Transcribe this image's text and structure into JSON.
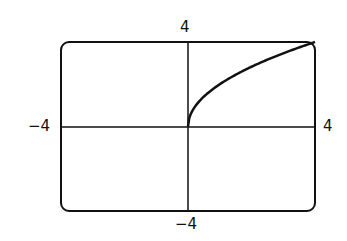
{
  "chart_data": {
    "type": "line",
    "title": "",
    "xlabel": "",
    "ylabel": "",
    "xlim": [
      -4,
      4
    ],
    "ylim": [
      -4,
      4
    ],
    "grid": false,
    "legend": null,
    "series": [
      {
        "name": "y = 2√x",
        "x": [
          0,
          0.25,
          0.5,
          1,
          1.5,
          2,
          2.5,
          3,
          3.5,
          4
        ],
        "y": [
          0,
          1,
          1.414,
          2,
          2.449,
          2.828,
          3.162,
          3.464,
          3.742,
          4
        ]
      }
    ],
    "tick_labels": {
      "x_min": "−4",
      "x_max": "4",
      "y_min": "−4",
      "y_max": "4"
    }
  }
}
